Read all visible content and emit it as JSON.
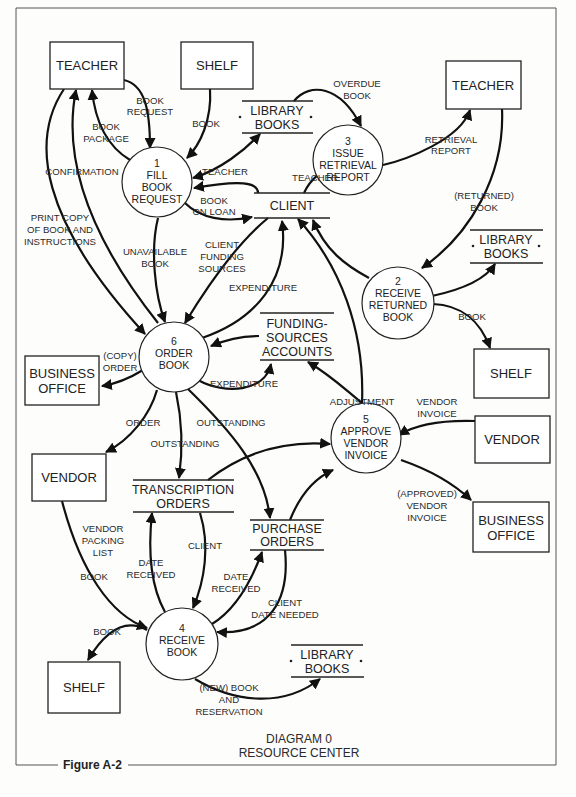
{
  "diagram": {
    "title_line1": "DIAGRAM 0",
    "title_line2": "RESOURCE CENTER",
    "figure_label": "Figure A-2"
  },
  "entities": {
    "teacher_top_left": "TEACHER",
    "shelf_top": "SHELF",
    "teacher_top_right": "TEACHER",
    "shelf_right": "SHELF",
    "business_office_left": [
      "BUSINESS",
      "OFFICE"
    ],
    "vendor_left": "VENDOR",
    "vendor_right": "VENDOR",
    "business_office_right": [
      "BUSINESS",
      "OFFICE"
    ],
    "shelf_bottom": "SHELF"
  },
  "processes": {
    "p1": [
      "1",
      "FILL",
      "BOOK",
      "REQUEST"
    ],
    "p2": [
      "2",
      "RECEIVE",
      "RETURNED",
      "BOOK"
    ],
    "p3": [
      "3",
      "ISSUE",
      "RETRIEVAL",
      "REPORT"
    ],
    "p4": [
      "4",
      "RECEIVE",
      "BOOK"
    ],
    "p5": [
      "5",
      "APPROVE",
      "VENDOR",
      "INVOICE"
    ],
    "p6": [
      "6",
      "ORDER",
      "BOOK"
    ]
  },
  "data_stores": {
    "library_books_top": [
      "LIBRARY",
      "BOOKS"
    ],
    "client": "CLIENT",
    "library_books_right": [
      "LIBRARY",
      "BOOKS"
    ],
    "funding_sources_accounts": [
      "FUNDING-",
      "SOURCES",
      "ACCOUNTS"
    ],
    "transcription_orders": [
      "TRANSCRIPTION",
      "ORDERS"
    ],
    "purchase_orders": [
      "PURCHASE",
      "ORDERS"
    ],
    "library_books_bottom": [
      "LIBRARY",
      "BOOKS"
    ]
  },
  "flows": {
    "book_request": [
      "BOOK",
      "REQUEST"
    ],
    "book_package": [
      "BOOK",
      "PACKAGE"
    ],
    "book_from_shelf": "BOOK",
    "confirmation": "CONFIRMATION",
    "print_copy": [
      "PRINT COPY",
      "OF BOOK AND",
      "INSTRUCTIONS"
    ],
    "teacher_client_to_p1": "TEACHER",
    "book_on_loan": [
      "BOOK",
      "ON LOAN"
    ],
    "teacher_client_to_p3": "TEACHER",
    "overdue_book": [
      "OVERDUE",
      "BOOK"
    ],
    "retrieval_report": [
      "RETRIEVAL",
      "REPORT"
    ],
    "returned_book": [
      "(RETURNED)",
      "BOOK"
    ],
    "book_to_shelf": "BOOK",
    "unavailable_book": [
      "UNAVAILABLE",
      "BOOK"
    ],
    "client_funding_sources": [
      "CLIENT",
      "FUNDING",
      "SOURCES"
    ],
    "expenditure_to_client": "EXPENDITURE",
    "expenditure_to_funding": "EXPENDITURE",
    "copy_order": [
      "(COPY)",
      "ORDER"
    ],
    "adjustment": "ADJUSTMENT",
    "vendor_invoice": [
      "VENDOR",
      "INVOICE"
    ],
    "order": "ORDER",
    "outstanding_transcription": "OUTSTANDING",
    "outstanding_purchase": "OUTSTANDING",
    "approved_vendor_invoice": [
      "(APPROVED)",
      "VENDOR",
      "INVOICE"
    ],
    "vendor_packing_list": [
      "VENDOR",
      "PACKING",
      "LIST"
    ],
    "book_from_vendor": "BOOK",
    "date_received_transcription": [
      "DATE",
      "RECEIVED"
    ],
    "client_transcription": "CLIENT",
    "date_received_purchase": [
      "DATE",
      "RECEIVED"
    ],
    "client_date_needed": [
      "CLIENT",
      "DATE NEEDED"
    ],
    "book_to_shelf_bottom": "BOOK",
    "new_book_reservation": [
      "(NEW) BOOK",
      "AND",
      "RESERVATION"
    ]
  }
}
